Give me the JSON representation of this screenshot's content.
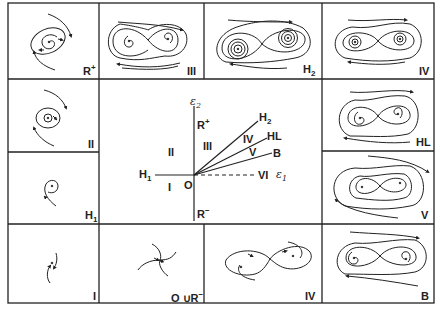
{
  "figure": {
    "center_plot": {
      "axis_vertical_label": "ε2",
      "axis_horizontal_label": "ε1",
      "origin_label": "O",
      "curve_labels": [
        "R+",
        "R−",
        "H1",
        "H2",
        "HL",
        "B"
      ],
      "region_labels": [
        "I",
        "II",
        "III",
        "IV",
        "V",
        "VI"
      ]
    },
    "panels": [
      {
        "id": "R+",
        "label": "R",
        "sup": "+",
        "position": "top-left"
      },
      {
        "id": "III",
        "label": "III",
        "position": "top-2"
      },
      {
        "id": "H2",
        "label": "H",
        "sub": "2",
        "position": "top-3"
      },
      {
        "id": "IV-top",
        "label": "IV",
        "position": "top-right"
      },
      {
        "id": "II",
        "label": "II",
        "position": "left-2"
      },
      {
        "id": "HL",
        "label": "HL",
        "position": "right-2"
      },
      {
        "id": "H1",
        "label": "H",
        "sub": "1",
        "position": "left-3"
      },
      {
        "id": "V",
        "label": "V",
        "position": "right-3"
      },
      {
        "id": "I",
        "label": "I",
        "position": "bottom-left"
      },
      {
        "id": "OuR-",
        "label": "O ∪R",
        "sup": "−",
        "position": "bottom-2"
      },
      {
        "id": "IV-bottom",
        "label": "IV",
        "position": "bottom-3"
      },
      {
        "id": "B",
        "label": "B",
        "position": "bottom-right"
      }
    ]
  },
  "labels": {
    "R_plus": "R",
    "R_plus_sup": "+",
    "III": "III",
    "H2": "H",
    "H2_sub": "2",
    "IV": "IV",
    "II": "II",
    "HL": "HL",
    "H1": "H",
    "H1_sub": "1",
    "V": "V",
    "I": "I",
    "OuR": "O ∪R",
    "OuR_sup": "−",
    "B": "B",
    "center": {
      "eps2": "ε",
      "eps2_sub": "2",
      "Rplus": "R",
      "Rplus_sup": "+",
      "Rminus": "R",
      "Rminus_sup": "−",
      "II": "II",
      "III": "III",
      "I": "I",
      "O": "O",
      "H1": "H",
      "H1_sub": "1",
      "H2": "H",
      "H2_sub": "2",
      "IV": "IV",
      "HL": "HL",
      "V": "V",
      "B": "B",
      "VI": "VI",
      "eps1": "ε",
      "eps1_sub": "1"
    }
  }
}
